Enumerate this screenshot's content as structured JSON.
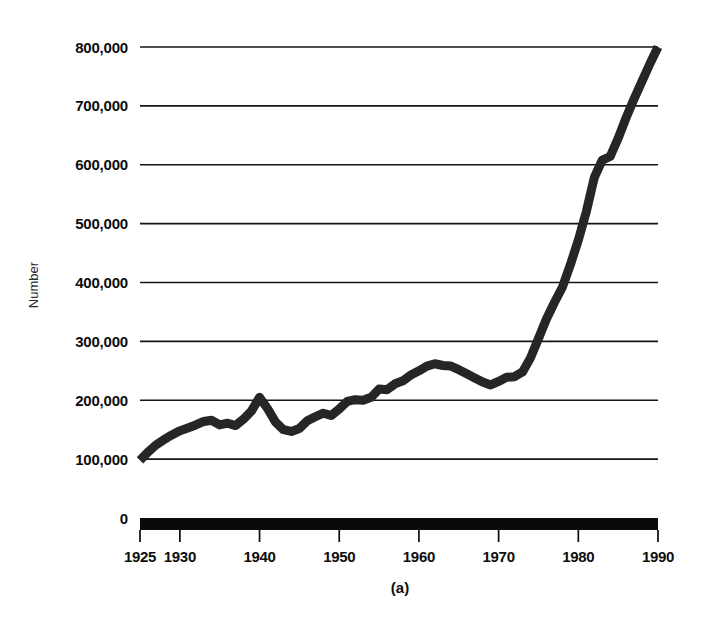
{
  "figure": {
    "caption": "(a)",
    "background_color": "#ffffff",
    "ink_color": "#262626"
  },
  "chart_data": {
    "type": "line",
    "title": "",
    "subtitle": "",
    "xlabel": "",
    "ylabel": "Number",
    "caption": "(a)",
    "grid": true,
    "legend": null,
    "legend_position": "none",
    "xlim": [
      1925,
      1990
    ],
    "ylim": [
      0,
      800000
    ],
    "x_tick_labels": [
      "1925",
      "1930",
      "1940",
      "1950",
      "1960",
      "1970",
      "1980",
      "1990"
    ],
    "x_tick_values": [
      1925,
      1930,
      1940,
      1950,
      1960,
      1970,
      1980,
      1990
    ],
    "y_tick_labels": [
      "0",
      "100,000",
      "200,000",
      "300,000",
      "400,000",
      "500,000",
      "600,000",
      "700,000",
      "800,000"
    ],
    "y_tick_values": [
      0,
      100000,
      200000,
      300000,
      400000,
      500000,
      600000,
      700000,
      800000
    ],
    "gridline_values": [
      100000,
      200000,
      300000,
      400000,
      500000,
      600000,
      700000,
      800000
    ],
    "series": [
      {
        "name": "Number",
        "color": "#262626",
        "x": [
          1925,
          1926,
          1927,
          1928,
          1929,
          1930,
          1931,
          1932,
          1933,
          1934,
          1935,
          1936,
          1937,
          1938,
          1939,
          1940,
          1941,
          1942,
          1943,
          1944,
          1945,
          1946,
          1947,
          1948,
          1949,
          1950,
          1951,
          1952,
          1953,
          1954,
          1955,
          1956,
          1957,
          1958,
          1959,
          1960,
          1961,
          1962,
          1963,
          1964,
          1965,
          1966,
          1967,
          1968,
          1969,
          1970,
          1971,
          1972,
          1973,
          1974,
          1975,
          1976,
          1977,
          1978,
          1979,
          1980,
          1981,
          1982,
          1983,
          1984,
          1985,
          1986,
          1987,
          1988,
          1989,
          1990
        ],
        "values": [
          98000,
          112000,
          124000,
          133000,
          141000,
          148000,
          153000,
          158000,
          164000,
          166000,
          158000,
          161000,
          157000,
          168000,
          182000,
          205000,
          186000,
          163000,
          150000,
          147000,
          152000,
          165000,
          172000,
          178000,
          174000,
          185000,
          198000,
          201000,
          200000,
          205000,
          219000,
          218000,
          228000,
          233000,
          243000,
          250000,
          258000,
          262000,
          259000,
          258000,
          252000,
          245000,
          238000,
          231000,
          226000,
          232000,
          239000,
          240000,
          248000,
          272000,
          305000,
          338000,
          366000,
          392000,
          430000,
          472000,
          520000,
          578000,
          608000,
          614000,
          645000,
          680000,
          712000,
          742000,
          772000,
          800000
        ]
      }
    ],
    "annotations": [],
    "notes": {
      "peak_1940": 205000,
      "wartime_trough_1944": 147000,
      "plateau_1962": 262000,
      "trough_1969": 226000,
      "endpoint_1990": 800000
    }
  },
  "axes": {
    "y_axis_title": "Number",
    "x_axis_style": "thick-black-bar"
  }
}
